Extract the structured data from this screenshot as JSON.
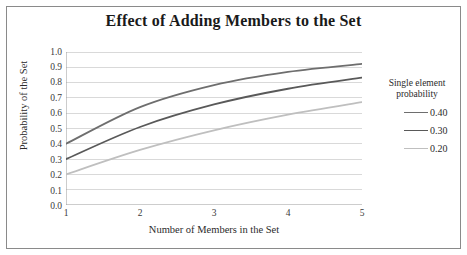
{
  "chart_data": {
    "type": "line",
    "title": "Effect of Adding Members to the Set",
    "xlabel": "Number of Members in the Set",
    "ylabel": "Probability of the Set",
    "x": [
      1,
      2,
      3,
      4,
      5
    ],
    "xlim": [
      1,
      5
    ],
    "ylim": [
      0.0,
      1.0
    ],
    "xticks": [
      "1",
      "2",
      "3",
      "4",
      "5"
    ],
    "yticks": [
      "1.0",
      "0.9",
      "0.8",
      "0.7",
      "0.6",
      "0.5",
      "0.4",
      "0.3",
      "0.2",
      "0.1",
      "0.0"
    ],
    "grid": "horizontal",
    "legend_position": "right",
    "legend_title": "Single element probability",
    "legend_title_lines": [
      "Single element",
      "probability"
    ],
    "series": [
      {
        "name": "0.40",
        "color": "#6e6e6e",
        "values": [
          0.4,
          0.64,
          0.784,
          0.8704,
          0.92224
        ]
      },
      {
        "name": "0.30",
        "color": "#595959",
        "values": [
          0.3,
          0.51,
          0.657,
          0.7599,
          0.83193
        ]
      },
      {
        "name": "0.20",
        "color": "#bfbfbf",
        "values": [
          0.2,
          0.36,
          0.488,
          0.5904,
          0.67232
        ]
      }
    ],
    "colors": {
      "grid": "#d9d9d9",
      "axis": "#9a9a9a",
      "text": "#2b2b2b",
      "frame": "#8a8a8a"
    }
  }
}
